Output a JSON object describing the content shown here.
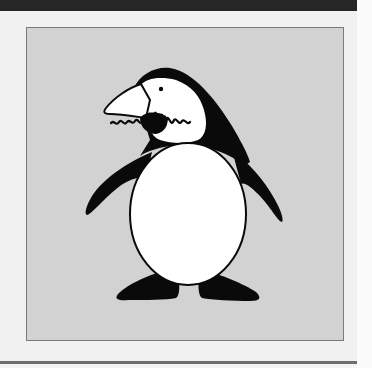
{
  "figure": {
    "colors": {
      "top_bar": "#262626",
      "page_background": "#f1f1f1",
      "panel_background": "#d2d2d2",
      "panel_border": "#7a7a7a",
      "ink": "#0a0a0a",
      "belly": "#ffffff",
      "bottom_rule": "#6e6e6e"
    }
  }
}
